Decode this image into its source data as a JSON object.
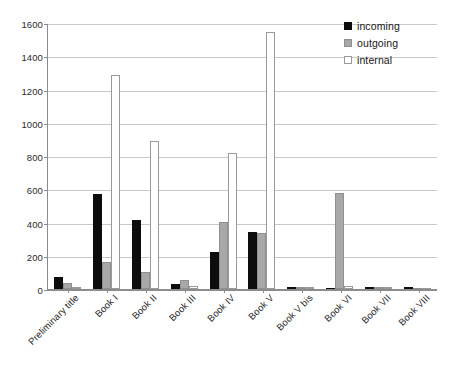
{
  "chart_data": {
    "type": "bar",
    "title": "",
    "subtitle": "",
    "xlabel": "",
    "ylabel": "",
    "ylim": [
      0,
      1600
    ],
    "ytick_step": 200,
    "yticks": [
      0,
      200,
      400,
      600,
      800,
      1000,
      1200,
      1400,
      1600
    ],
    "ytick_labels": [
      "0",
      "200",
      "400",
      "600",
      "800",
      "1000",
      "1200",
      "1400",
      "1600"
    ],
    "grid": true,
    "grid_axis": "y",
    "legend_position": "top-right",
    "categories": [
      "Preliminary title",
      "Book I",
      "Book II",
      "Book III",
      "Book IV",
      "Book V",
      "Book V bis",
      "Book VI",
      "Book VII",
      "Book VIII"
    ],
    "series": [
      {
        "name": "incoming",
        "color": "#0d0d0d",
        "values": [
          75,
          570,
          415,
          30,
          225,
          345,
          5,
          0,
          8,
          3
        ]
      },
      {
        "name": "outgoing",
        "color": "#a8a8a8",
        "values": [
          35,
          160,
          105,
          55,
          405,
          335,
          8,
          575,
          10,
          0
        ]
      },
      {
        "name": "internal",
        "color": "#ffffff",
        "values": [
          10,
          1285,
          890,
          20,
          820,
          1545,
          3,
          20,
          4,
          0
        ]
      }
    ]
  },
  "legend": {
    "items": [
      {
        "label": "incoming",
        "swatch": "black-square-icon"
      },
      {
        "label": "outgoing",
        "swatch": "gray-square-icon"
      },
      {
        "label": "internal",
        "swatch": "white-square-icon"
      }
    ]
  }
}
